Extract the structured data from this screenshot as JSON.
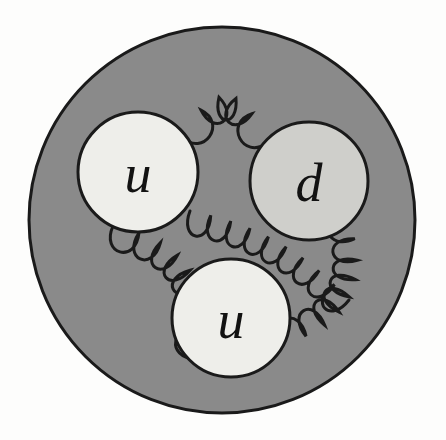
{
  "figure": {
    "name": "proton-structure-diagram",
    "background_color": "#fdfdfc"
  },
  "proton": {
    "name": "proton",
    "label": "proton",
    "fill_color": "#8a8a8a",
    "stroke_color": "#1a1a1a",
    "cx": 222,
    "cy": 220,
    "r": 193,
    "stroke_width": 3
  },
  "quarks": [
    {
      "id": "quark-u-left",
      "label": "u",
      "flavor": "up",
      "cx": 138,
      "cy": 172,
      "r": 60,
      "fill_color": "#eeeeea",
      "stroke_color": "#1a1a1a",
      "font_size": 54
    },
    {
      "id": "quark-d-right",
      "label": "d",
      "flavor": "down",
      "cx": 309,
      "cy": 181,
      "r": 59,
      "fill_color": "#cfcfcb",
      "stroke_color": "#1a1a1a",
      "font_size": 54
    },
    {
      "id": "quark-u-bottom",
      "label": "u",
      "flavor": "up",
      "cx": 231,
      "cy": 318,
      "r": 59,
      "fill_color": "#eeeeea",
      "stroke_color": "#1a1a1a",
      "font_size": 54
    }
  ],
  "gluons": [
    {
      "id": "gluon-top",
      "label": "gluon u-d top",
      "connects": [
        "quark-u-left",
        "quark-d-right"
      ],
      "x1": 182,
      "y1": 137,
      "x2": 267,
      "y2": 143,
      "bow": -44,
      "loops": 5,
      "loop_width": 19,
      "stroke_color": "#1a1a1a",
      "stroke_width": 3
    },
    {
      "id": "gluon-diagonal",
      "label": "gluon middle diagonal",
      "connects": [
        "quark-u-left",
        "quark-d-right"
      ],
      "x1": 190,
      "y1": 211,
      "x2": 349,
      "y2": 300,
      "bow": -16,
      "loops": 9,
      "loop_width": 20,
      "stroke_color": "#1a1a1a",
      "stroke_width": 3
    },
    {
      "id": "gluon-left",
      "label": "gluon u-left to u-bottom",
      "connects": [
        "quark-u-left",
        "quark-u-bottom"
      ],
      "x1": 113,
      "y1": 226,
      "x2": 196,
      "y2": 359,
      "bow": -42,
      "loops": 8,
      "loop_width": 20,
      "stroke_color": "#1a1a1a",
      "stroke_width": 3
    },
    {
      "id": "gluon-right",
      "label": "gluon d to u-bottom",
      "connects": [
        "quark-d-right",
        "quark-u-bottom"
      ],
      "x1": 348,
      "y1": 215,
      "x2": 283,
      "y2": 345,
      "bow": -38,
      "loops": 8,
      "loop_width": 20,
      "stroke_color": "#1a1a1a",
      "stroke_width": 3
    }
  ],
  "legend": {
    "quark_count": 3,
    "gluon_count": 4,
    "composition": "uud"
  }
}
